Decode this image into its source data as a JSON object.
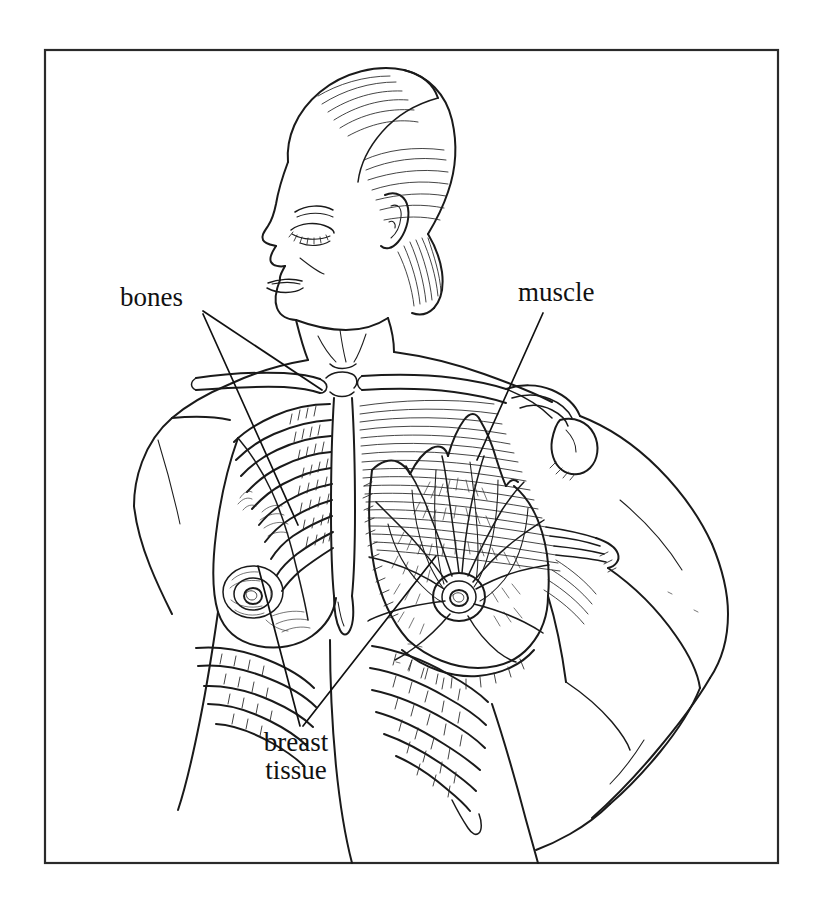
{
  "figure": {
    "kind": "anatomical-line-illustration",
    "style": "black-and-white pen-and-ink hatched medical illustration",
    "background_color": "#ffffff",
    "ink_color": "#1a1a1a",
    "frame": {
      "present": true,
      "stroke_color": "#2a2a2a",
      "x": 45,
      "y": 50,
      "width": 733,
      "height": 813
    }
  },
  "labels": [
    {
      "id": "bones",
      "text": "bones",
      "x": 120,
      "y": 283,
      "leader_count": 2,
      "points_to": [
        "clavicle",
        "ribs"
      ]
    },
    {
      "id": "muscle",
      "text": "muscle",
      "x": 518,
      "y": 278,
      "leader_count": 1,
      "points_to": [
        "pectoralis major"
      ]
    },
    {
      "id": "breast_tissue",
      "text_line_1": "breast",
      "text_line_2": "tissue",
      "x": 250,
      "y": 728,
      "leader_count": 2,
      "points_to": [
        "intact right breast",
        "dissected left breast lobes"
      ]
    }
  ],
  "anatomy": {
    "head": "female head in left profile, eyes closed, hair swept back",
    "neck": "neck with sternocleidomastoid contour",
    "intact_side": "viewer-left breast shown with skin intact, nipple and areola",
    "dissected_side": "viewer-right breast dissected showing radiating glandular lobes converging on the nipple",
    "skeleton": "clavicles, sternum, rib cage with costal cartilage",
    "musculature": "pectoralis major fibers fanning from sternum to humerus, deltoid at shoulder",
    "arm": "viewer-right arm raised and bent at elbow, hand resting on hip"
  },
  "colors": {
    "ink": "#1a1a1a",
    "paper": "#ffffff",
    "frame": "#2a2a2a",
    "label": "#111111"
  }
}
